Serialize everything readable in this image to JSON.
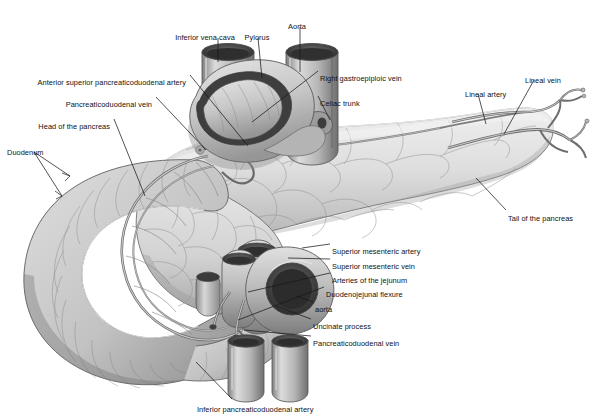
{
  "figure": {
    "background_color": "#ffffff",
    "label_color": "#111111",
    "leader_color": "#1a1a1a",
    "tissue_colors": {
      "pancreas_light": "#e6e6e6",
      "pancreas_mid": "#cfcfcf",
      "pancreas_shadow": "#a8a8a8",
      "duodenum_light": "#dcdcdc",
      "duodenum_mid": "#bdbdbd",
      "duodenum_shadow": "#8f8f8f",
      "vessel_light": "#d2d2d2",
      "vessel_mid": "#9e9e9e",
      "vessel_dark": "#5a5a5a",
      "lumen_dark": "#3a3a3a",
      "outline": "#4a4a4a"
    }
  },
  "labels": [
    {
      "id": "inferior-vena-cava",
      "text": "Inferior vena cava",
      "x": 205,
      "y": 33,
      "align": "center"
    },
    {
      "id": "pylorus",
      "text": "Pylorus",
      "x": 257,
      "y": 33,
      "align": "center"
    },
    {
      "id": "aorta-top",
      "text": "Aorta",
      "x": 297,
      "y": 22,
      "align": "center"
    },
    {
      "id": "anterior-superior-pancreaticoduodenal-artery",
      "text": "Anterior superior pancreaticoduodenal artery",
      "x": 186,
      "y": 78,
      "align": "right"
    },
    {
      "id": "pancreaticoduodenal-vein-upper",
      "text": "Pancreaticoduodenal vein",
      "x": 152,
      "y": 100,
      "align": "right"
    },
    {
      "id": "head-of-the-pancreas",
      "text": "Head of the pancreas",
      "x": 110,
      "y": 122,
      "align": "right"
    },
    {
      "id": "duodenum",
      "text": "Duodenum",
      "x": 7,
      "y": 148,
      "align": "left"
    },
    {
      "id": "right-gastroepiploic-vein",
      "text": "Right gastroepiploic vein",
      "x": 320,
      "y": 74,
      "align": "left"
    },
    {
      "id": "celiac-trunk",
      "text": "Celiac trunk",
      "x": 320,
      "y": 99,
      "align": "left"
    },
    {
      "id": "lineal-artery",
      "text": "Lineal artery",
      "x": 465,
      "y": 90,
      "align": "left"
    },
    {
      "id": "lineal-vein",
      "text": "Lineal vein",
      "x": 525,
      "y": 76,
      "align": "left"
    },
    {
      "id": "tail-of-the-pancreas",
      "text": "Tail of the pancreas",
      "x": 508,
      "y": 214,
      "align": "left"
    },
    {
      "id": "superior-mesenteric-artery",
      "text": "Superior mesenteric artery",
      "x": 332,
      "y": 247,
      "align": "left"
    },
    {
      "id": "superior-mesenteric-vein",
      "text": "Superior mesenteric vein",
      "x": 332,
      "y": 262,
      "align": "left"
    },
    {
      "id": "arteries-of-the-jejunum",
      "text": "Arteries of the jejunum",
      "x": 332,
      "y": 276,
      "align": "left"
    },
    {
      "id": "duodenojejunal-flexure",
      "text": "Duodenojejunal flexure",
      "x": 326,
      "y": 290,
      "align": "left"
    },
    {
      "id": "aorta-lower",
      "text": "aorta",
      "x": 315,
      "y": 305,
      "align": "left"
    },
    {
      "id": "uncinate-process",
      "text": "Uncinate process",
      "x": 313,
      "y": 322,
      "align": "left"
    },
    {
      "id": "pancreaticoduodenal-vein-lower",
      "text": "Pancreaticoduodenal vein",
      "x": 313,
      "y": 339,
      "align": "left"
    },
    {
      "id": "inferior-pancreaticoduodenal-artery",
      "text": "Inferior pancreaticoduodenal artery",
      "x": 197,
      "y": 405,
      "align": "left"
    }
  ]
}
